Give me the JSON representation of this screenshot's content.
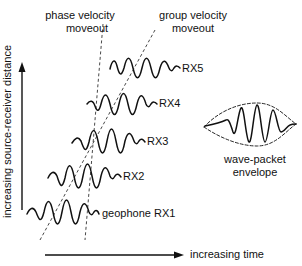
{
  "labels": {
    "phase_velocity": [
      "phase velocity",
      "moveout"
    ],
    "group_velocity": [
      "group velocity",
      "moveout"
    ],
    "y_axis": "increasing source-receiver distance",
    "x_axis": "increasing time",
    "envelope": [
      "wave-packet",
      "envelope"
    ]
  },
  "receivers": [
    {
      "id": "RX5",
      "label": "RX5"
    },
    {
      "id": "RX4",
      "label": "RX4"
    },
    {
      "id": "RX3",
      "label": "RX3"
    },
    {
      "id": "RX2",
      "label": "RX2"
    },
    {
      "id": "RX1",
      "label": "geophone RX1"
    }
  ],
  "colors": {
    "ink": "#111111",
    "background": "#ffffff"
  }
}
